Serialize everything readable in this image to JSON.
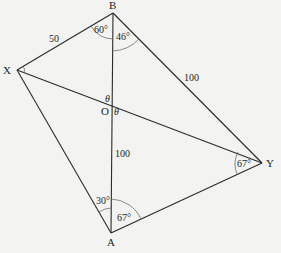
{
  "figure": {
    "type": "geometry-diagram",
    "vertices": {
      "B": {
        "label": "B",
        "x": 113,
        "y": 13
      },
      "X": {
        "label": "X",
        "x": 17,
        "y": 70
      },
      "O": {
        "label": "O",
        "x": 113,
        "y": 110
      },
      "A": {
        "label": "A",
        "x": 111,
        "y": 233
      },
      "Y": {
        "label": "Y",
        "x": 262,
        "y": 163
      }
    },
    "segments": [
      {
        "from": "X",
        "to": "B",
        "length_label": "50"
      },
      {
        "from": "B",
        "to": "Y",
        "length_label": "100"
      },
      {
        "from": "O",
        "to": "A",
        "length_label": "100"
      },
      {
        "from": "X",
        "to": "A",
        "length_label": ""
      },
      {
        "from": "A",
        "to": "Y",
        "length_label": ""
      },
      {
        "from": "B",
        "to": "A",
        "length_label": ""
      },
      {
        "from": "X",
        "to": "Y",
        "length_label": ""
      }
    ],
    "angles": {
      "XBO": "60°",
      "OBY": "46°",
      "XAO": "30°",
      "OAY": "67°",
      "XYA": "67°",
      "theta_upper": "θ",
      "theta_lower": "θ"
    },
    "colors": {
      "line": "#2a2a2a",
      "background": "#f3f3f1"
    }
  }
}
